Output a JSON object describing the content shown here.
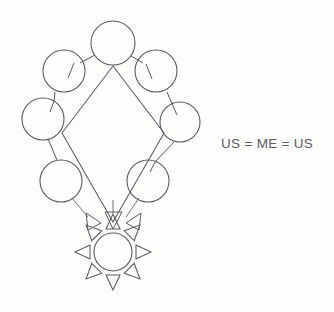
{
  "canvas": {
    "width": 334,
    "height": 312,
    "background_color": "#fdfdfc",
    "ink_color": "#55555b",
    "title": "US = ME = US hand-drawn concept diagram"
  },
  "annotation": {
    "equation_label": "US = ME = US"
  },
  "nodes": [
    {
      "id": "top",
      "name": "top-circle",
      "cx": 113,
      "cy": 43,
      "r": 22
    },
    {
      "id": "upper-left",
      "name": "upper-left-circle",
      "cx": 64,
      "cy": 71,
      "r": 21
    },
    {
      "id": "upper-right",
      "name": "upper-right-circle",
      "cx": 156,
      "cy": 71,
      "r": 21
    },
    {
      "id": "mid-left",
      "name": "middle-left-circle",
      "cx": 43,
      "cy": 119,
      "r": 21
    },
    {
      "id": "mid-right",
      "name": "middle-right-circle",
      "cx": 180,
      "cy": 122,
      "r": 20
    },
    {
      "id": "lower-left",
      "name": "lower-left-circle",
      "cx": 61,
      "cy": 181,
      "r": 21
    },
    {
      "id": "lower-right",
      "name": "lower-right-circle",
      "cx": 148,
      "cy": 181,
      "r": 21
    }
  ],
  "sun": {
    "name": "sun-node",
    "cx": 113,
    "cy": 252,
    "r": 19,
    "ray_count": 8,
    "ray_length": 15,
    "ray_half_width": 7,
    "ray_gap": 4
  },
  "diamond": {
    "name": "central-diamond",
    "points": "113,66 164,133 113,222 62,133"
  },
  "connector_stubs": [
    {
      "name": "stub-top-to-upper-left",
      "x1": 95,
      "y1": 55,
      "x2": 80,
      "y2": 63
    },
    {
      "name": "stub-top-to-upper-right",
      "x1": 131,
      "y1": 56,
      "x2": 143,
      "y2": 63
    },
    {
      "name": "stub-upper-left-inner",
      "x1": 74,
      "y1": 63,
      "x2": 68,
      "y2": 78
    },
    {
      "name": "stub-upper-right-inner",
      "x1": 146,
      "y1": 64,
      "x2": 152,
      "y2": 79
    },
    {
      "name": "stub-upper-left-to-mid-left",
      "x1": 55,
      "y1": 92,
      "x2": 54,
      "y2": 101
    },
    {
      "name": "stub-upper-right-to-mid-right",
      "x1": 167,
      "y1": 92,
      "x2": 172,
      "y2": 104
    },
    {
      "name": "stub-mid-left-inner",
      "x1": 54,
      "y1": 101,
      "x2": 50,
      "y2": 112
    },
    {
      "name": "stub-mid-right-inner",
      "x1": 172,
      "y1": 104,
      "x2": 177,
      "y2": 115
    },
    {
      "name": "stub-mid-left-to-lower-left",
      "x1": 48,
      "y1": 139,
      "x2": 57,
      "y2": 160
    },
    {
      "name": "stub-mid-right-to-lower-right",
      "x1": 174,
      "y1": 142,
      "x2": 155,
      "y2": 162
    },
    {
      "name": "stub-lower-right-inner",
      "x1": 155,
      "y1": 162,
      "x2": 150,
      "y2": 172
    }
  ],
  "flows": [
    {
      "name": "flow-lower-left-to-sun",
      "line": {
        "x1": 72,
        "y1": 198,
        "x2": 88,
        "y2": 217
      },
      "head": "86,213 101,223 88,230"
    },
    {
      "name": "flow-diamond-to-sun",
      "line": {
        "x1": 113,
        "y1": 200,
        "x2": 113,
        "y2": 213
      },
      "head": "105,212 122,212 113,229"
    },
    {
      "name": "flow-lower-right-to-sun",
      "line": {
        "x1": 139,
        "y1": 198,
        "x2": 126,
        "y2": 217
      },
      "head": "141,213 126,223 139,230"
    }
  ]
}
